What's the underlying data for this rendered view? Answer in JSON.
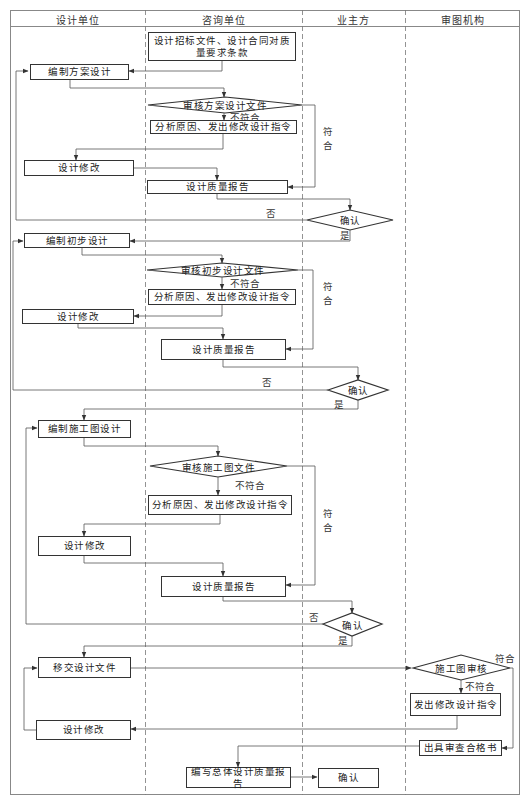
{
  "columns": [
    "设计单位",
    "咨询单位",
    "业主方",
    "审图机构"
  ],
  "stage1": {
    "start": "设计招标文件、设计合同对质量要求条款",
    "draft": "编制方案设计",
    "review": "审核方案设计文件",
    "fail_label": "不符合",
    "analyze": "分析原因、发出修改设计指令",
    "pass_label": "符合",
    "revise": "设计修改",
    "report": "设计质量报告",
    "confirm": "确认",
    "no_label": "否",
    "yes_label": "是"
  },
  "stage2": {
    "draft": "编制初步设计",
    "review": "审核初步设计文件",
    "fail_label": "不符合",
    "analyze": "分析原因、发出修改设计指令",
    "pass_label": "符合",
    "revise": "设计修改",
    "report": "设计质量报告",
    "confirm": "确认",
    "no_label": "否",
    "yes_label": "是"
  },
  "stage3": {
    "draft": "编制施工图设计",
    "review": "审核施工图文件",
    "fail_label": "不符合",
    "analyze": "分析原因、发出修改设计指令",
    "pass_label": "符合",
    "revise": "设计修改",
    "report": "设计质量报告",
    "confirm": "确认",
    "no_label": "否",
    "yes_label": "是"
  },
  "stage4": {
    "handover": "移交设计文件",
    "review": "施工图审核",
    "pass_label": "符合",
    "fail_label": "不符合",
    "instruct": "发出修改设计指令",
    "revise": "设计修改",
    "certificate": "出具审查合格书",
    "final_report": "编写总体设计质量报告",
    "final_confirm": "确认"
  }
}
